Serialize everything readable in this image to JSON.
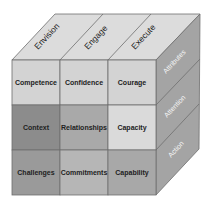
{
  "diagram": {
    "type": "3x3x3 cube",
    "top_labels": [
      "Envision",
      "Engage",
      "Execute"
    ],
    "side_labels": [
      "Attributes",
      "Attention",
      "Action"
    ],
    "front_cells": [
      [
        {
          "label": "Competence",
          "color": "#d3d3d3"
        },
        {
          "label": "Confidence",
          "color": "#d3d3d3"
        },
        {
          "label": "Courage",
          "color": "#d3d3d3"
        }
      ],
      [
        {
          "label": "Context",
          "color": "#8c8c8c"
        },
        {
          "label": "Relationships",
          "color": "#a9a9a9"
        },
        {
          "label": "Capacity",
          "color": "#dadada"
        }
      ],
      [
        {
          "label": "Challenges",
          "color": "#9a9a9a"
        },
        {
          "label": "Commitments",
          "color": "#b6b6b6"
        },
        {
          "label": "Capability",
          "color": "#a8a8a8"
        }
      ]
    ],
    "colors": {
      "top_face": "#dcdcdc",
      "side_face": "#a4a4a4",
      "grid_line": "#6e6e6e"
    }
  }
}
